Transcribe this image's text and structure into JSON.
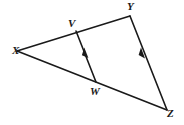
{
  "figure": {
    "background_color": "#ffffff",
    "stroke_color": "#1a1a1a",
    "label_color": "#1a1a1a",
    "width": 184,
    "height": 125,
    "vertices": [
      {
        "id": "x",
        "label": "X",
        "point_x": 17,
        "point_y": 51,
        "label_x": 12,
        "label_y": 45
      },
      {
        "id": "v",
        "label": "V",
        "point_x": 76,
        "point_y": 31,
        "label_x": 68,
        "label_y": 18
      },
      {
        "id": "y",
        "label": "Y",
        "point_x": 130,
        "point_y": 16,
        "label_x": 127,
        "label_y": 1
      },
      {
        "id": "w",
        "label": "W",
        "point_x": 96,
        "point_y": 82,
        "label_x": 90,
        "label_y": 86
      },
      {
        "id": "z",
        "label": "Z",
        "point_x": 167,
        "point_y": 110,
        "label_x": 167,
        "label_y": 108
      }
    ],
    "segments": [
      {
        "id": "xy",
        "from": "X",
        "to": "Y",
        "x1": 17,
        "y1": 51,
        "x2": 130,
        "y2": 16,
        "tick_marks": 0
      },
      {
        "id": "xz",
        "from": "X",
        "to": "Z",
        "x1": 17,
        "y1": 51,
        "x2": 167,
        "y2": 110,
        "tick_marks": 0
      },
      {
        "id": "vw",
        "from": "V",
        "to": "W",
        "x1": 76,
        "y1": 31,
        "x2": 96,
        "y2": 82,
        "tick_marks": 1
      },
      {
        "id": "yz",
        "from": "Y",
        "to": "Z",
        "x1": 130,
        "y1": 16,
        "x2": 167,
        "y2": 110,
        "tick_marks": 1
      }
    ],
    "parallel_marks": [
      {
        "id": "vw-arrow",
        "segment": "vw",
        "x": 84,
        "y": 55,
        "direction": "toward-V"
      },
      {
        "id": "yz-arrow",
        "segment": "yz",
        "x": 142,
        "y": 56,
        "direction": "toward-Y"
      }
    ]
  }
}
